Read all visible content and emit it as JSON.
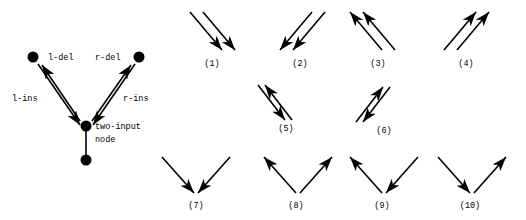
{
  "figure": {
    "title": "",
    "stroke_color": "#000000",
    "background": "#ffffff",
    "left_diagram": {
      "name": "two-input-node-diagram",
      "labels": {
        "l_del": "l-del",
        "r_del": "r-del",
        "l_ins": "l-ins",
        "r_ins": "r-ins",
        "center_line1": "two-input",
        "center_line2": "node"
      },
      "nodes": [
        {
          "id": "top-left",
          "cx": 33,
          "cy": 57,
          "r": 5.5
        },
        {
          "id": "top-right",
          "cx": 139,
          "cy": 57,
          "r": 5.5
        },
        {
          "id": "center",
          "cx": 86,
          "cy": 126,
          "r": 5.5
        },
        {
          "id": "bottom",
          "cx": 86,
          "cy": 160,
          "r": 5.5
        }
      ],
      "edges": [
        {
          "id": "l-del",
          "from": "center",
          "to": "top-left",
          "arrow": "head-at-end"
        },
        {
          "id": "l-ins",
          "from": "top-left",
          "to": "center",
          "arrow": "head-at-end"
        },
        {
          "id": "r-del",
          "from": "center",
          "to": "top-right",
          "arrow": "head-at-end"
        },
        {
          "id": "r-ins",
          "from": "top-right",
          "to": "center",
          "arrow": "head-at-end"
        },
        {
          "id": "stem",
          "from": "center",
          "to": "bottom",
          "arrow": "none"
        }
      ]
    },
    "cases": [
      {
        "caption": "(1)",
        "kind": "parallel",
        "direction": "down-right",
        "cap_x": 212,
        "cap_y": 66
      },
      {
        "caption": "(2)",
        "kind": "parallel",
        "direction": "down-left",
        "cap_x": 300,
        "cap_y": 66
      },
      {
        "caption": "(3)",
        "kind": "parallel",
        "direction": "up-left",
        "cap_x": 378,
        "cap_y": 66
      },
      {
        "caption": "(4)",
        "kind": "parallel",
        "direction": "up-right",
        "cap_x": 466,
        "cap_y": 66
      },
      {
        "caption": "(5)",
        "kind": "antiparallel",
        "direction": "nwse",
        "cap_x": 286,
        "cap_y": 131
      },
      {
        "caption": "(6)",
        "kind": "antiparallel",
        "direction": "swne",
        "cap_x": 384,
        "cap_y": 133
      },
      {
        "caption": "(7)",
        "kind": "vee",
        "direction": "both-in",
        "cap_x": 196,
        "cap_y": 208
      },
      {
        "caption": "(8)",
        "kind": "vee",
        "direction": "both-out",
        "cap_x": 296,
        "cap_y": 208
      },
      {
        "caption": "(9)",
        "kind": "vee",
        "direction": "left-out-right-in",
        "cap_x": 382,
        "cap_y": 208
      },
      {
        "caption": "(10)",
        "kind": "vee",
        "direction": "left-in-right-out",
        "cap_x": 470,
        "cap_y": 208
      }
    ]
  }
}
